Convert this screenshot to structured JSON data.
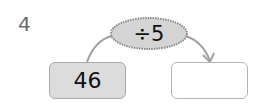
{
  "question": {
    "number": "4"
  },
  "operation": {
    "label": "÷5",
    "fill": "#d4d4d4",
    "border": "#8a8a8a"
  },
  "input_box": {
    "value": "46",
    "fill": "#dcdcdc"
  },
  "output_box": {
    "value": ""
  },
  "arrow": {
    "color": "#a3a3a3"
  }
}
